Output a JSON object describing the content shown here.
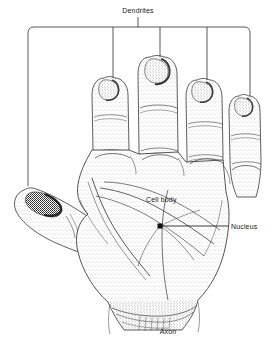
{
  "figure": {
    "style": "stippled pen-and-ink anatomical illustration",
    "background_color": "#ffffff",
    "ink_color": "#1a1a1a",
    "leader_line_color": "#3a3a3a"
  },
  "labels": {
    "dendrites": "Dendrites",
    "cell_body": "Cell body",
    "nucleus": "Nucleus",
    "axon": "Axon"
  },
  "annotations": {
    "dendrites": {
      "text": "Dendrites",
      "x": 138,
      "y": 12,
      "bracket": {
        "left_x": 28,
        "right_x": 250,
        "top_y": 27,
        "corner_radius": 6,
        "stem_x": 138,
        "stem_top_y": 16,
        "stem_bottom_y": 27
      },
      "pointers": [
        {
          "x": 28,
          "y_end": 186,
          "target": "thumb-tip"
        },
        {
          "x": 113,
          "y_end": 78,
          "target": "index-fingertip"
        },
        {
          "x": 160,
          "y_end": 57,
          "target": "middle-fingertip"
        },
        {
          "x": 207,
          "y_end": 80,
          "target": "ring-fingertip"
        },
        {
          "x": 250,
          "y_end": 96,
          "target": "little-fingertip"
        }
      ]
    },
    "cell_body": {
      "text": "Cell body",
      "x": 146,
      "y": 199,
      "target": "palm"
    },
    "nucleus": {
      "text": "Nucleus",
      "x": 232,
      "y": 228,
      "marker": {
        "x": 160,
        "y": 226,
        "size": 5,
        "shape": "filled-square"
      },
      "leader": {
        "x1": 162,
        "y1": 226,
        "x2": 227,
        "y2": 226
      }
    },
    "axon": {
      "text": "Axon",
      "x": 168,
      "y": 332,
      "target": "wrist"
    }
  }
}
